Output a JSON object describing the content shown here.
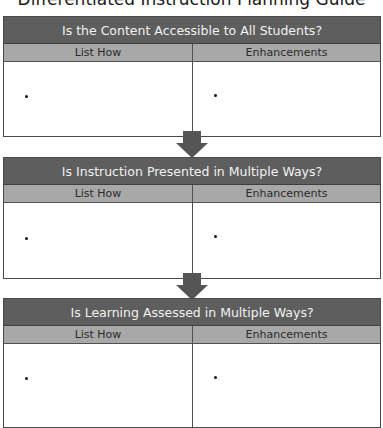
{
  "document": {
    "title": "Differentiated Instruction Planning Guide"
  },
  "sections": [
    {
      "question": "Is the Content Accessible to All Students?",
      "columns": [
        "List How",
        "Enhancements"
      ],
      "bullets": [
        "",
        ""
      ]
    },
    {
      "question": "Is Instruction Presented in Multiple Ways?",
      "columns": [
        "List How",
        "Enhancements"
      ],
      "bullets": [
        "",
        ""
      ]
    },
    {
      "question": "Is Learning Assessed in Multiple Ways?",
      "columns": [
        "List How",
        "Enhancements"
      ],
      "bullets": [
        "",
        ""
      ]
    }
  ],
  "colors": {
    "header_bg": "#5e5e5e",
    "header_text": "#f2f2f2",
    "subheader_bg": "#a8a8a8",
    "arrow": "#555555",
    "border": "#4a4a4a"
  },
  "icons": {
    "flow_arrow": "down-arrow-icon",
    "bullet": "bullet-point-icon"
  }
}
